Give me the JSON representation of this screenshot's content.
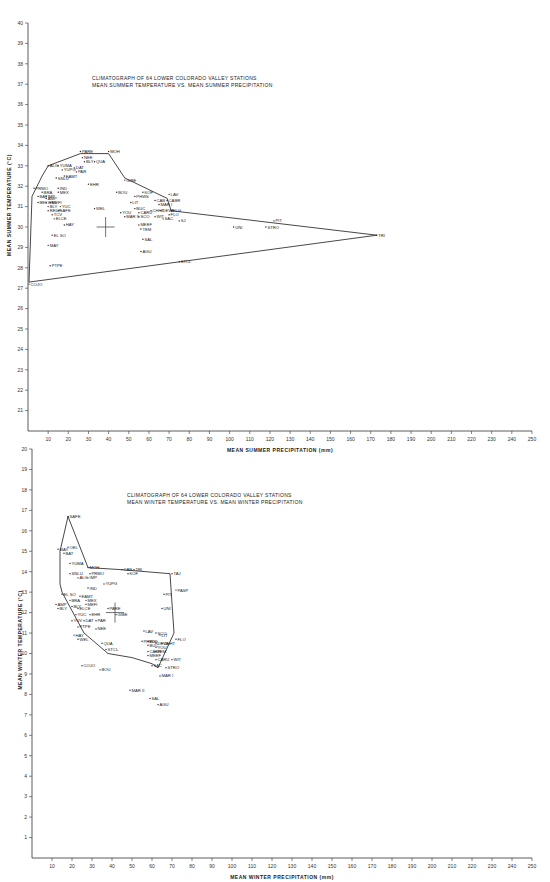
{
  "chart_data": [
    {
      "type": "scatter",
      "title": "CLIMATOGRAPH OF 64 LOWER COLORADO VALLEY STATIONS",
      "subtitle": "MEAN SUMMER TEMPERATURE VS. MEAN SUMMER PRECIPITATION",
      "xlabel": "MEAN SUMMER PRECIPITATION (mm)",
      "ylabel": "MEAN SUMMER TEMPERATURE (°C)",
      "xlim": [
        0,
        250
      ],
      "ylim": [
        20,
        40
      ],
      "xticks": [
        10,
        20,
        30,
        40,
        50,
        60,
        70,
        80,
        90,
        100,
        110,
        120,
        130,
        140,
        150,
        160,
        170,
        180,
        190,
        200,
        210,
        220,
        230,
        240,
        250
      ],
      "yticks": [
        21,
        22,
        23,
        24,
        25,
        26,
        27,
        28,
        29,
        30,
        31,
        32,
        33,
        34,
        35,
        36,
        37,
        38,
        39,
        40
      ],
      "grid": false,
      "mean_marker": {
        "x": 38.5,
        "y": 30.0
      },
      "envelope": [
        [
          0.5,
          27.3
        ],
        [
          2,
          31.5
        ],
        [
          7,
          32.5
        ],
        [
          10,
          33.0
        ],
        [
          26,
          33.6
        ],
        [
          40,
          33.6
        ],
        [
          48,
          32.4
        ],
        [
          69,
          31.4
        ],
        [
          71,
          30.8
        ],
        [
          173,
          29.6
        ],
        [
          0.5,
          27.3
        ]
      ],
      "points": [
        {
          "label": "PARE",
          "x": 26,
          "y": 33.7
        },
        {
          "label": "MOH",
          "x": 40,
          "y": 33.7
        },
        {
          "label": "NEE",
          "x": 27,
          "y": 33.4
        },
        {
          "label": "BLY",
          "x": 28,
          "y": 33.2
        },
        {
          "label": "QUA",
          "x": 33,
          "y": 33.2
        },
        {
          "label": "ALG",
          "x": 10,
          "y": 33.0
        },
        {
          "label": "YUMA",
          "x": 15,
          "y": 33.0
        },
        {
          "label": "DAT",
          "x": 23,
          "y": 32.9
        },
        {
          "label": "YUPG",
          "x": 17,
          "y": 32.8
        },
        {
          "label": "PAR",
          "x": 24,
          "y": 32.7
        },
        {
          "label": "EAMT",
          "x": 18,
          "y": 32.5
        },
        {
          "label": "SNLU",
          "x": 14,
          "y": 32.4
        },
        {
          "label": "EHR",
          "x": 30,
          "y": 32.1
        },
        {
          "label": "GIBE",
          "x": 48,
          "y": 32.3
        },
        {
          "label": "PRMO",
          "x": 3,
          "y": 31.9
        },
        {
          "label": "IND",
          "x": 15,
          "y": 31.9
        },
        {
          "label": "BRA",
          "x": 7,
          "y": 31.7
        },
        {
          "label": "MEX",
          "x": 15,
          "y": 31.7
        },
        {
          "label": "BOU",
          "x": 44,
          "y": 31.7
        },
        {
          "label": "KOF",
          "x": 57,
          "y": 31.7
        },
        {
          "label": "LAV",
          "x": 70,
          "y": 31.6
        },
        {
          "label": "BAT",
          "x": 5,
          "y": 31.5
        },
        {
          "label": "IMP",
          "x": 9,
          "y": 31.5
        },
        {
          "label": "PHWS",
          "x": 53,
          "y": 31.5
        },
        {
          "label": "AMP",
          "x": 9,
          "y": 31.4
        },
        {
          "label": "CABR",
          "x": 69,
          "y": 31.3
        },
        {
          "label": "BEL",
          "x": 5,
          "y": 31.2
        },
        {
          "label": "WEL",
          "x": 9,
          "y": 31.2
        },
        {
          "label": "MEFI",
          "x": 11,
          "y": 31.2
        },
        {
          "label": "CAB",
          "x": 63,
          "y": 31.3
        },
        {
          "label": "MAR I",
          "x": 65,
          "y": 31.1
        },
        {
          "label": "LIT",
          "x": 51,
          "y": 31.2
        },
        {
          "label": "BLY",
          "x": 10,
          "y": 31.0
        },
        {
          "label": "YUC",
          "x": 16,
          "y": 31.0
        },
        {
          "label": "WEL",
          "x": 33,
          "y": 30.9
        },
        {
          "label": "BUC",
          "x": 53,
          "y": 30.9
        },
        {
          "label": "CHHT",
          "x": 61,
          "y": 30.8
        },
        {
          "label": "DEVA",
          "x": 66,
          "y": 30.8
        },
        {
          "label": "ELG",
          "x": 71,
          "y": 30.8
        },
        {
          "label": "REDF",
          "x": 10,
          "y": 30.8
        },
        {
          "label": "SAFE",
          "x": 15,
          "y": 30.8
        },
        {
          "label": "YOU",
          "x": 46,
          "y": 30.7
        },
        {
          "label": "CARU",
          "x": 55,
          "y": 30.7
        },
        {
          "label": "FLO",
          "x": 70,
          "y": 30.6
        },
        {
          "label": "TCV",
          "x": 12,
          "y": 30.6
        },
        {
          "label": "MAR II",
          "x": 48,
          "y": 30.5
        },
        {
          "label": "SCO",
          "x": 55,
          "y": 30.5
        },
        {
          "label": "WIT",
          "x": 63,
          "y": 30.5
        },
        {
          "label": "SAC",
          "x": 67,
          "y": 30.4
        },
        {
          "label": "SJ",
          "x": 75,
          "y": 30.3
        },
        {
          "label": "ELCE",
          "x": 13,
          "y": 30.4
        },
        {
          "label": "HAY",
          "x": 18,
          "y": 30.1
        },
        {
          "label": "MEEF",
          "x": 55,
          "y": 30.1
        },
        {
          "label": "TEM",
          "x": 56,
          "y": 29.9
        },
        {
          "label": "UNI",
          "x": 102,
          "y": 30.0
        },
        {
          "label": "STRO",
          "x": 118,
          "y": 30.0
        },
        {
          "label": "PIT",
          "x": 122,
          "y": 30.3
        },
        {
          "label": "TRI",
          "x": 173,
          "y": 29.6
        },
        {
          "label": "EL SO",
          "x": 12,
          "y": 29.6
        },
        {
          "label": "SAL",
          "x": 57,
          "y": 29.4
        },
        {
          "label": "MAY",
          "x": 10,
          "y": 29.1
        },
        {
          "label": "AGU",
          "x": 56,
          "y": 28.8
        },
        {
          "label": "STCL",
          "x": 75,
          "y": 28.3
        },
        {
          "label": "PTPE",
          "x": 11,
          "y": 28.1
        },
        {
          "label": "COJO",
          "x": 0.5,
          "y": 27.2
        }
      ]
    },
    {
      "type": "scatter",
      "title": "CLIMATOGRAPH OF 64 LOWER COLORADO VALLEY STATIONS",
      "subtitle": "MEAN WINTER TEMPERATURE VS. MEAN WINTER PRECIPITATION",
      "xlabel": "MEAN WINTER PRECIPITATION (mm)",
      "ylabel": "MEAN WINTER TEMPERATURE (°C)",
      "xlim": [
        0,
        250
      ],
      "ylim": [
        0,
        20
      ],
      "xticks": [
        10,
        20,
        30,
        40,
        50,
        60,
        70,
        80,
        90,
        100,
        110,
        120,
        130,
        140,
        150,
        160,
        170,
        180,
        190,
        200,
        210,
        220,
        230,
        240,
        250
      ],
      "yticks": [
        1,
        2,
        3,
        4,
        5,
        6,
        7,
        8,
        9,
        10,
        11,
        12,
        13,
        14,
        15,
        16,
        17,
        18,
        19,
        20
      ],
      "grid": false,
      "mean_marker": {
        "x": 41.5,
        "y": 12.0
      },
      "envelope": [
        [
          18,
          16.7
        ],
        [
          14,
          15.0
        ],
        [
          14,
          13.4
        ],
        [
          15,
          13.0
        ],
        [
          26,
          11.0
        ],
        [
          38,
          10.0
        ],
        [
          50,
          9.8
        ],
        [
          60,
          9.5
        ],
        [
          63,
          9.3
        ],
        [
          71,
          11.0
        ],
        [
          69,
          13.9
        ],
        [
          45,
          14.1
        ],
        [
          28,
          14.2
        ],
        [
          18,
          16.7
        ]
      ],
      "points": [
        {
          "label": "SAFE",
          "x": 18,
          "y": 16.7
        },
        {
          "label": "MAY",
          "x": 13,
          "y": 15.1
        },
        {
          "label": "OEL",
          "x": 18,
          "y": 15.2
        },
        {
          "label": "BAT",
          "x": 16,
          "y": 14.9
        },
        {
          "label": "YUMA",
          "x": 19,
          "y": 14.4
        },
        {
          "label": "MOH",
          "x": 28,
          "y": 14.2
        },
        {
          "label": "CAB",
          "x": 45,
          "y": 14.1
        },
        {
          "label": "TRI",
          "x": 51,
          "y": 14.1
        },
        {
          "label": "KOF",
          "x": 48,
          "y": 13.9
        },
        {
          "label": "TAJ",
          "x": 70,
          "y": 13.9
        },
        {
          "label": "SNLU",
          "x": 19,
          "y": 13.9
        },
        {
          "label": "PRMO",
          "x": 29,
          "y": 13.9
        },
        {
          "label": "ALG",
          "x": 23,
          "y": 13.7
        },
        {
          "label": "IMP",
          "x": 28,
          "y": 13.7
        },
        {
          "label": "YUPG",
          "x": 36,
          "y": 13.4
        },
        {
          "label": "IND",
          "x": 28,
          "y": 13.2
        },
        {
          "label": "PASP",
          "x": 72,
          "y": 13.1
        },
        {
          "label": "EL SO",
          "x": 15,
          "y": 12.9
        },
        {
          "label": "EAMT",
          "x": 24,
          "y": 12.8
        },
        {
          "label": "MEX",
          "x": 27,
          "y": 12.6
        },
        {
          "label": "PIT",
          "x": 66,
          "y": 12.9
        },
        {
          "label": "BRA",
          "x": 19,
          "y": 12.6
        },
        {
          "label": "MEFI",
          "x": 27,
          "y": 12.4
        },
        {
          "label": "AMP",
          "x": 12,
          "y": 12.4
        },
        {
          "label": "BLY",
          "x": 13,
          "y": 12.2
        },
        {
          "label": "BLY",
          "x": 20,
          "y": 12.3
        },
        {
          "label": "ELCE",
          "x": 23,
          "y": 12.2
        },
        {
          "label": "PARE",
          "x": 38,
          "y": 12.2
        },
        {
          "label": "GIBE",
          "x": 42,
          "y": 11.9
        },
        {
          "label": "UNI",
          "x": 65,
          "y": 12.2
        },
        {
          "label": "YUC",
          "x": 22,
          "y": 11.9
        },
        {
          "label": "EHR",
          "x": 29,
          "y": 11.9
        },
        {
          "label": "YUV",
          "x": 20,
          "y": 11.6
        },
        {
          "label": "DAT",
          "x": 26,
          "y": 11.6
        },
        {
          "label": "PAR",
          "x": 32,
          "y": 11.6
        },
        {
          "label": "PTPE",
          "x": 23,
          "y": 11.3
        },
        {
          "label": "NEE",
          "x": 32,
          "y": 11.2
        },
        {
          "label": "LAV",
          "x": 56,
          "y": 11.1
        },
        {
          "label": "SCO",
          "x": 62,
          "y": 11.0
        },
        {
          "label": "LIT",
          "x": 64,
          "y": 10.9
        },
        {
          "label": "FLO",
          "x": 72,
          "y": 10.7
        },
        {
          "label": "HAY",
          "x": 21,
          "y": 10.9
        },
        {
          "label": "WEL",
          "x": 23,
          "y": 10.7
        },
        {
          "label": "PHWS",
          "x": 55,
          "y": 10.6
        },
        {
          "label": "ELG",
          "x": 58,
          "y": 10.6
        },
        {
          "label": "DEVA",
          "x": 62,
          "y": 10.5
        },
        {
          "label": "CHHT",
          "x": 65,
          "y": 10.5
        },
        {
          "label": "QUA",
          "x": 35,
          "y": 10.5
        },
        {
          "label": "BUC",
          "x": 58,
          "y": 10.4
        },
        {
          "label": "YOU",
          "x": 62,
          "y": 10.3
        },
        {
          "label": "STCL",
          "x": 37,
          "y": 10.2
        },
        {
          "label": "CABR",
          "x": 58,
          "y": 10.1
        },
        {
          "label": "TEM",
          "x": 62,
          "y": 10.1
        },
        {
          "label": "MEEF",
          "x": 58,
          "y": 9.9
        },
        {
          "label": "CARU",
          "x": 62,
          "y": 9.7
        },
        {
          "label": "WIT",
          "x": 70,
          "y": 9.7
        },
        {
          "label": "COJO",
          "x": 25,
          "y": 9.4
        },
        {
          "label": "BOU",
          "x": 34,
          "y": 9.2
        },
        {
          "label": "SAC",
          "x": 60,
          "y": 9.4
        },
        {
          "label": "STRO",
          "x": 67,
          "y": 9.3
        },
        {
          "label": "MAR I",
          "x": 64,
          "y": 8.9
        },
        {
          "label": "MAR II",
          "x": 49,
          "y": 8.2
        },
        {
          "label": "SAL",
          "x": 59,
          "y": 7.8
        },
        {
          "label": "AGU",
          "x": 63,
          "y": 7.5
        }
      ]
    }
  ],
  "layout": {
    "charts": [
      {
        "x0": 28,
        "xscale": 2.016,
        "y0": 431,
        "yscale": 20.4,
        "ymin": 20,
        "axis_top": 23,
        "axis_right": 532,
        "title_x": 92,
        "title_y": 80,
        "xlabel_x": 280,
        "xlabel_y": 452,
        "ylabel_x": 11,
        "ylabel_y": 205
      },
      {
        "x0": 32,
        "xscale": 2.0,
        "y0": 858,
        "yscale": 20.45,
        "ymin": 0,
        "axis_top": 449,
        "axis_right": 532,
        "title_x": 127,
        "title_y": 497,
        "xlabel_x": 282,
        "xlabel_y": 879,
        "ylabel_x": 22,
        "ylabel_y": 640
      }
    ]
  }
}
